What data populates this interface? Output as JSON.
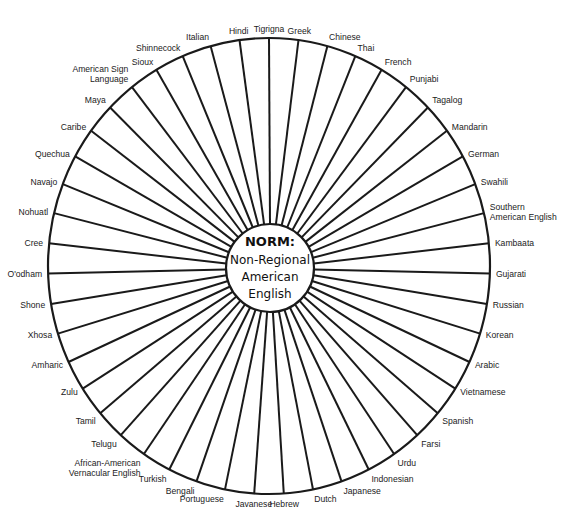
{
  "diagram": {
    "center": {
      "title": "NORM:",
      "lines": [
        "Non-Regional",
        "American",
        "English"
      ]
    },
    "labels": [
      [
        "Tigrigna"
      ],
      [
        "Greek"
      ],
      [
        "Chinese"
      ],
      [
        "Thai"
      ],
      [
        "French"
      ],
      [
        "Punjabi"
      ],
      [
        "Tagalog"
      ],
      [
        "Mandarin"
      ],
      [
        "German"
      ],
      [
        "Swahili"
      ],
      [
        "Southern",
        "American English"
      ],
      [
        "Kambaata"
      ],
      [
        "Gujarati"
      ],
      [
        "Russian"
      ],
      [
        "Korean"
      ],
      [
        "Arabic"
      ],
      [
        "Vietnamese"
      ],
      [
        "Spanish"
      ],
      [
        "Farsi"
      ],
      [
        "Urdu"
      ],
      [
        "Indonesian"
      ],
      [
        "Japanese"
      ],
      [
        "Dutch"
      ],
      [
        "Hebrew"
      ],
      [
        "Javanese"
      ],
      [
        "Portuguese"
      ],
      [
        "Bengali"
      ],
      [
        "Turkish"
      ],
      [
        "African-American",
        "Vernacular English"
      ],
      [
        "Telugu"
      ],
      [
        "Tamil"
      ],
      [
        "Zulu"
      ],
      [
        "Amharic"
      ],
      [
        "Xhosa"
      ],
      [
        "Shone"
      ],
      [
        "O'odham"
      ],
      [
        "Cree"
      ],
      [
        "Nohuatl"
      ],
      [
        "Navajo"
      ],
      [
        "Quechua"
      ],
      [
        "Caribe"
      ],
      [
        "Maya"
      ],
      [
        "American Sign",
        "Language"
      ],
      [
        "Sioux"
      ],
      [
        "Shinnecock"
      ],
      [
        "Italian"
      ],
      [
        "Hindi"
      ]
    ],
    "colors": {
      "line": "#1a1a1a",
      "text": "#222222",
      "background": "#ffffff"
    }
  }
}
